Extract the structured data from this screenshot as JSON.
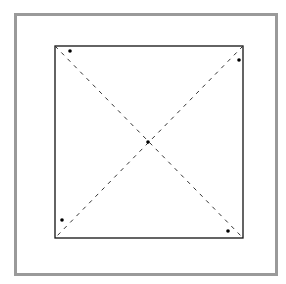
{
  "frame": {
    "border_color": "#9a9a9a"
  },
  "square": {
    "x1": 55,
    "y1": 46,
    "x2": 243,
    "y2": 238,
    "stroke": "#111111"
  },
  "diagonals": {
    "style": "dashed",
    "stroke": "#333333"
  },
  "points": [
    {
      "name": "top-left",
      "x": 70,
      "y": 51
    },
    {
      "name": "top-right",
      "x": 239,
      "y": 60
    },
    {
      "name": "center",
      "x": 148,
      "y": 142
    },
    {
      "name": "bottom-left",
      "x": 62,
      "y": 220
    },
    {
      "name": "bottom-right",
      "x": 228,
      "y": 231
    }
  ]
}
